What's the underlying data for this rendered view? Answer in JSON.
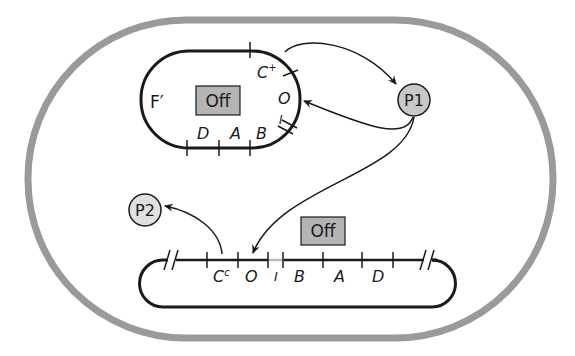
{
  "cell": {
    "border_color": "#9a9a9a"
  },
  "plasmid": {
    "name": "F′",
    "state_label": "Off",
    "genes": {
      "c": "C",
      "c_sup": "+",
      "o": "O",
      "i": "I",
      "b": "B",
      "a": "A",
      "d": "D"
    }
  },
  "chromosome": {
    "state_label": "Off",
    "genes": {
      "c": "C",
      "c_sup": "c",
      "o": "O",
      "i": "I",
      "b": "B",
      "a": "A",
      "d": "D"
    }
  },
  "proteins": {
    "p1": {
      "label": "P1",
      "fill": "#c8c8c8"
    },
    "p2": {
      "label": "P2",
      "fill": "#e0e0e0"
    }
  },
  "colors": {
    "off_box": "#b4b4b4",
    "line": "#1a1a1a"
  }
}
